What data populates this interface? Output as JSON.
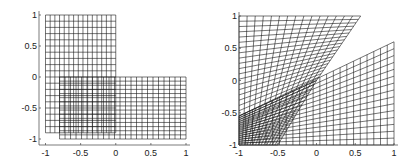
{
  "chart_data": [
    {
      "type": "line",
      "title": "",
      "xlabel": "",
      "ylabel": "",
      "xlim": [
        -1,
        1
      ],
      "ylim": [
        -1,
        1
      ],
      "xticks": [
        -1,
        -0.5,
        0,
        0.5,
        1
      ],
      "yticks": [
        -1,
        -0.5,
        0,
        0.5,
        1
      ],
      "xtick_labels": [
        "-1",
        "-0.5",
        "0",
        "0.5",
        "1"
      ],
      "ytick_labels": [
        "-1",
        "-0.5",
        "0",
        "0.5",
        "1"
      ],
      "grid": false,
      "legend": "none",
      "description": "Two overlapping rectangular meshes (L-shaped domain decomposition)",
      "meshes": [
        {
          "name": "upper-left rectangle",
          "corners": [
            [
              -1,
              -0.9
            ],
            [
              0,
              -0.9
            ],
            [
              0,
              1
            ],
            [
              -1,
              1
            ]
          ],
          "nu": 15,
          "nv": 19
        },
        {
          "name": "lower rectangle",
          "corners": [
            [
              -0.8,
              -1
            ],
            [
              1,
              -1
            ],
            [
              1,
              0
            ],
            [
              -0.8,
              0
            ]
          ],
          "nu": 23,
          "nv": 15
        }
      ],
      "pixel_frame": {
        "x0": 45.5,
        "x1": 186,
        "y0": 139,
        "y1": 15,
        "axis_left": 39,
        "axis_bottom": 145
      }
    },
    {
      "type": "line",
      "title": "",
      "xlabel": "",
      "ylabel": "",
      "xlim": [
        -1,
        1
      ],
      "ylim": [
        -1,
        1
      ],
      "xticks": [
        -1,
        -0.5,
        0,
        0.5,
        1
      ],
      "yticks": [
        -1,
        -0.5,
        0,
        0.5,
        1
      ],
      "xtick_labels": [
        "-1",
        "-0.5",
        "0",
        "0.5",
        "1"
      ],
      "ytick_labels": [
        "-1",
        "-0.5",
        "0",
        "0.5",
        "1"
      ],
      "grid": false,
      "legend": "none",
      "description": "Mapped (sheared) images of the two meshes",
      "meshes": [
        {
          "name": "upper wedge",
          "corners": [
            [
              -1,
              -0.55
            ],
            [
              0,
              0
            ],
            [
              0.57,
              1
            ],
            [
              -1,
              1
            ]
          ],
          "nu": 15,
          "nv": 19
        },
        {
          "name": "lower fan",
          "corners": [
            [
              -1,
              -1
            ],
            [
              1,
              -1
            ],
            [
              1,
              0.6
            ],
            [
              -1,
              -0.55
            ]
          ],
          "nu": 23,
          "nv": 15
        },
        {
          "name": "overlap region",
          "corners": [
            [
              -1,
              -1
            ],
            [
              -0.5,
              -1
            ],
            [
              0,
              0
            ],
            [
              -1,
              -0.55
            ]
          ],
          "nu": 14,
          "nv": 16
        }
      ],
      "pixel_frame": {
        "x0": 239,
        "x1": 394,
        "y0": 145,
        "y1": 16,
        "axis_left": 239,
        "axis_bottom": 145
      }
    }
  ],
  "colors": {
    "mesh": "#1a1a1a",
    "axis": "#444444",
    "background": "#ffffff"
  }
}
